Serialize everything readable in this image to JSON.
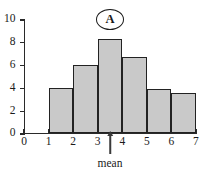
{
  "chart_data": {
    "type": "bar",
    "title": "A",
    "panel_label": "A",
    "xlabel": "",
    "ylabel": "",
    "categories": [
      "1-2",
      "2-3",
      "3-4",
      "4-5",
      "5-6",
      "6-7"
    ],
    "bin_edges": [
      1,
      2,
      3,
      4,
      5,
      6,
      7
    ],
    "values": [
      4.0,
      6.0,
      8.3,
      6.7,
      3.9,
      3.5
    ],
    "xlim": [
      0,
      7
    ],
    "ylim": [
      0,
      10
    ],
    "x_ticks": [
      0,
      1,
      2,
      3,
      4,
      5,
      6,
      7
    ],
    "y_ticks": [
      0,
      2,
      4,
      6,
      8,
      10
    ],
    "grid": false,
    "legend": false,
    "annotations": [
      {
        "name": "mean",
        "label": "mean",
        "x": 3.5,
        "style": "up-arrow-below-axis"
      }
    ],
    "style": {
      "bar_fill": "#c9c9c9",
      "bar_edge": "#222222",
      "axis_color": "#2a2a2a",
      "text_color": "#1a1a1a",
      "background": "#ffffff"
    }
  },
  "labels": {
    "y_ticks": [
      "0",
      "2",
      "4",
      "6",
      "8",
      "10"
    ],
    "x_ticks": [
      "0",
      "1",
      "2",
      "3",
      "4",
      "5",
      "6",
      "7"
    ],
    "panel": "A",
    "mean": "mean"
  }
}
